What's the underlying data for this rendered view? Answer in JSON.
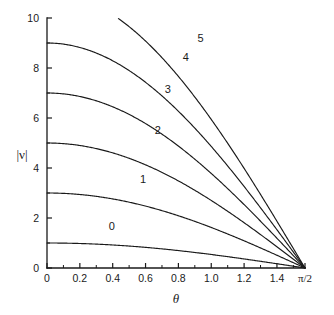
{
  "chart_data": {
    "type": "line",
    "title": "",
    "xlabel": "θ",
    "ylabel": "|ν|",
    "xlim": [
      0,
      1.5707963
    ],
    "ylim": [
      0,
      10
    ],
    "grid": false,
    "legend_position": "inline-curve-labels",
    "x_tick_labels": [
      "0",
      "0.2",
      "0.4",
      "0.6",
      "0.8",
      "1.0",
      "1.2",
      "1.4",
      "π/2"
    ],
    "x_tick_values": [
      0,
      0.2,
      0.4,
      0.6,
      0.8,
      1.0,
      1.2,
      1.4,
      1.5707963
    ],
    "x_minor_ticks": [
      0.1,
      0.3,
      0.5,
      0.7,
      0.9,
      1.1,
      1.3,
      1.5
    ],
    "y_tick_labels": [
      "0",
      "2",
      "4",
      "6",
      "8",
      "10"
    ],
    "y_tick_values": [
      0,
      2,
      4,
      6,
      8,
      10
    ],
    "y_minor_ticks": [
      1,
      3,
      5,
      7,
      9
    ],
    "series": [
      {
        "name": "0",
        "amplitude": 1,
        "label": "0",
        "label_x": 0.395,
        "label_y": 1.53
      },
      {
        "name": "1",
        "amplitude": 3,
        "label": "1",
        "label_x": 0.585,
        "label_y": 3.42
      },
      {
        "name": "2",
        "amplitude": 5,
        "label": "2",
        "label_x": 0.675,
        "label_y": 5.36
      },
      {
        "name": "3",
        "amplitude": 7,
        "label": "3",
        "label_x": 0.735,
        "label_y": 7.02
      },
      {
        "name": "4",
        "amplitude": 9,
        "label": "4",
        "label_x": 0.845,
        "label_y": 8.28
      },
      {
        "name": "5",
        "amplitude": 11,
        "label": "5",
        "label_x": 0.935,
        "label_y": 9.05
      }
    ],
    "curve_formula": "|v| = (2n+1) * cos(theta)",
    "annotations": [
      "0",
      "1",
      "2",
      "3",
      "4",
      "5"
    ]
  },
  "axis": {
    "y_label_text": "|ν|",
    "x_label_text": "θ"
  }
}
